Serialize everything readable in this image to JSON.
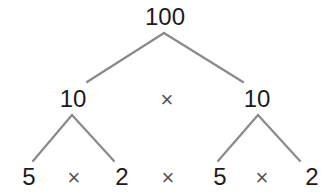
{
  "diagram": {
    "type": "factor-tree",
    "line_color": "#8a8a8a",
    "text_color": "#1c1c1c",
    "root": {
      "label": "100"
    },
    "level1": {
      "left": {
        "label": "10"
      },
      "operator": "×",
      "right": {
        "label": "10"
      }
    },
    "level2": {
      "items": [
        {
          "label": "5"
        },
        {
          "label": "×"
        },
        {
          "label": "2"
        },
        {
          "label": "×"
        },
        {
          "label": "5"
        },
        {
          "label": "×"
        },
        {
          "label": "2"
        }
      ]
    },
    "edges": [
      {
        "from": "100",
        "to": "10 (left)"
      },
      {
        "from": "100",
        "to": "10 (right)"
      },
      {
        "from": "10 (left)",
        "to": "5"
      },
      {
        "from": "10 (left)",
        "to": "2"
      },
      {
        "from": "10 (right)",
        "to": "5"
      },
      {
        "from": "10 (right)",
        "to": "2"
      }
    ]
  }
}
